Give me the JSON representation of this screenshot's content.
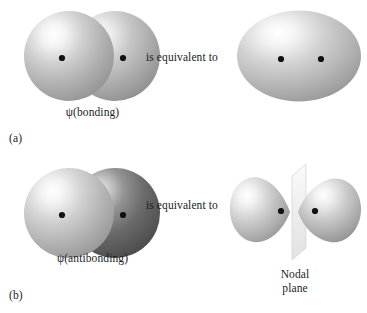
{
  "figure": {
    "type": "diagram",
    "background_color": "#ffffff",
    "ink_color": "#1c1c1c"
  },
  "panels": [
    {
      "letter": "(a)",
      "orbital_label": "ψ(bonding)",
      "relation_text": "is equivalent to",
      "left_shape": {
        "name": "two-overlapping-spheres",
        "count": 2,
        "shading": "radial highlight upper-left",
        "fill_light": "#fdfdfd",
        "fill_mid": "#bfbfbf",
        "fill_dark": "#9a9a9a",
        "phase": [
          "same",
          "same"
        ],
        "nuclei_dots": 2
      },
      "right_shape": {
        "name": "merged-ellipsoid",
        "shading": "radial highlight upper-left",
        "fill_light": "#fdfdfd",
        "fill_mid": "#c2c2c2",
        "fill_dark": "#9c9c9c",
        "nuclei_dots": 2
      },
      "nodal_plane_label": null
    },
    {
      "letter": "(b)",
      "orbital_label": "ψ(antibonding)",
      "relation_text": "is equivalent to",
      "left_shape": {
        "name": "two-overlapping-spheres-opposite-phase",
        "count": 2,
        "shading": "radial highlight upper-left",
        "fill_light": "#fdfdfd",
        "fill_mid": "#bfbfbf",
        "fill_dark": "#9a9a9a",
        "fill_dark_light": "#9d9d9d",
        "fill_dark_mid": "#6f6f6f",
        "fill_dark_deep": "#4f4f4f",
        "phase": [
          "positive",
          "negative"
        ],
        "nuclei_dots": 2
      },
      "right_shape": {
        "name": "two-lobes-with-nodal-plane",
        "lobes": 2,
        "plane": "vertical parallelogram in perspective",
        "plane_fill": "#f2f2f2",
        "plane_edge": "#cfcfcf",
        "fill_light": "#fdfdfd",
        "fill_mid": "#c0c0c0",
        "fill_dark": "#8f8f8f",
        "nuclei_dots": 2
      },
      "nodal_plane_label": {
        "line1": "Nodal",
        "line2": "plane"
      }
    }
  ]
}
